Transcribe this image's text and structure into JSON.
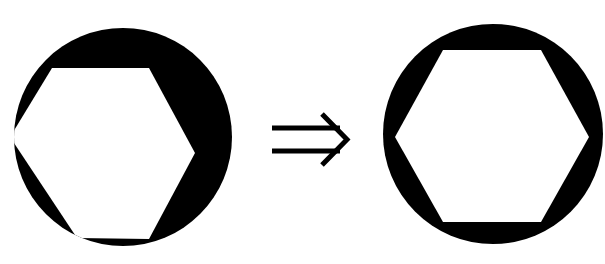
{
  "diagram": {
    "colors": {
      "fill": "#000000",
      "background": "#ffffff",
      "hexagon": "#ffffff"
    },
    "left_figure": {
      "label": "misaligned hexagon in circle",
      "circle": {
        "cx": 123,
        "cy": 137,
        "r": 109
      },
      "hexagon_points": "52,68 149,68 195,153 149,239 77,238 10,137"
    },
    "arrow": {
      "label": "implies arrow",
      "glyph": "⇒",
      "upper_line": {
        "x1": 272,
        "y1": 128,
        "x2": 340,
        "y2": 128
      },
      "lower_line": {
        "x1": 272,
        "y1": 151,
        "x2": 340,
        "y2": 151
      },
      "head": "322,114 347,139.5 322,165"
    },
    "right_figure": {
      "label": "centered hexagon in circle",
      "circle": {
        "cx": 493,
        "cy": 134,
        "r": 110
      },
      "hexagon_points": "443,50 541,50 589,137 541,222 443,222 395,137"
    }
  }
}
